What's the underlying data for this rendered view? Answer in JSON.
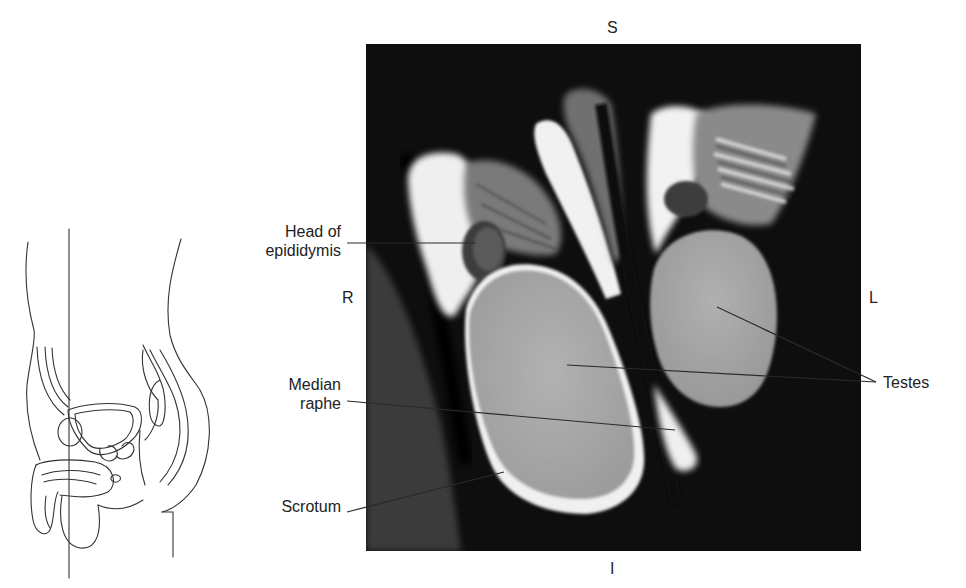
{
  "figure": {
    "orientation": {
      "superior": "S",
      "inferior": "I",
      "right": "R",
      "left": "L"
    },
    "labels": {
      "head_of_epididymis_line1": "Head of",
      "head_of_epididymis_line2": "epididymis",
      "median_raphe_line1": "Median",
      "median_raphe_line2": "raphe",
      "scrotum": "Scrotum",
      "testes": "Testes"
    },
    "locator_diagram": {
      "description": "Sagittal line drawing of male pelvis with vertical plane line indicating coronal section"
    },
    "image": {
      "description": "Coronal MRI of scrotum showing both testes, epididymides and median raphe"
    },
    "colors": {
      "background": "#ffffff",
      "mri_background": "#0d0d0d",
      "testis_gray": "#a9a9a9",
      "fluid_white": "#f2f2f2",
      "leader_line": "#2a2a2a",
      "text": "#222222"
    }
  }
}
